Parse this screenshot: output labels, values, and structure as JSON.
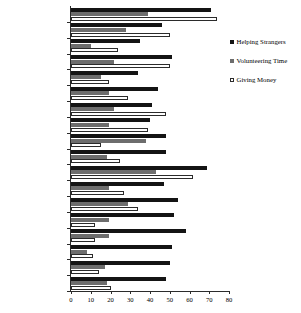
{
  "chart_data": {
    "type": "bar",
    "title": "",
    "xlabel": "",
    "ylabel": "",
    "orientation": "horizontal",
    "xlim": [
      0,
      80
    ],
    "xticks": [
      0,
      10,
      20,
      30,
      40,
      50,
      60,
      70,
      80
    ],
    "grid": false,
    "legend_position": "right",
    "categories": [
      "Oceania",
      "Western Europe",
      "Southern Europe",
      "Northern Europe",
      "Eastern Europe",
      "Southern Asia",
      "Southeastern Asia",
      "East Asia",
      "Central Asia",
      "South America",
      "North America",
      "Central America",
      "Caribbean America",
      "Western Africa",
      "Southern Africa",
      "Northern Africa",
      "Middle Africa",
      "Eastern Africa"
    ],
    "series": [
      {
        "name": "Helping Strangers",
        "color": "#141414",
        "values": [
          71,
          46,
          35,
          51,
          34,
          44,
          41,
          40,
          48,
          48,
          69,
          47,
          54,
          52,
          58,
          51,
          50,
          48
        ]
      },
      {
        "name": "Volunteering Time",
        "color": "#6d6d6d",
        "values": [
          39,
          28,
          10,
          22,
          15,
          19,
          22,
          19,
          38,
          18,
          43,
          19,
          29,
          19,
          19,
          8,
          17,
          18
        ]
      },
      {
        "name": "Giving Money",
        "color": "#ffffff",
        "values": [
          74,
          50,
          24,
          50,
          19,
          29,
          48,
          39,
          15,
          25,
          62,
          27,
          34,
          12,
          12,
          11,
          14,
          20
        ]
      }
    ]
  },
  "legend": {
    "items": [
      {
        "label": "Helping Strangers",
        "swatch": "filled-black-square-icon"
      },
      {
        "label": "Volunteering Time",
        "swatch": "filled-gray-square-icon"
      },
      {
        "label": "Giving Money",
        "swatch": "outlined-white-square-icon"
      }
    ]
  }
}
